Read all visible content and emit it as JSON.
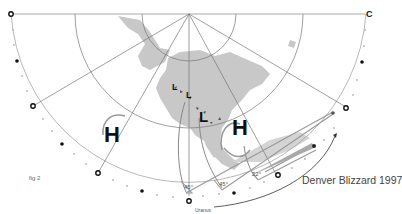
{
  "figure": {
    "title": "Denver Blizzard 1997",
    "figure_label": "fig 2",
    "planet_label": "Uranus",
    "corner_label": "C",
    "angles": [
      "45°",
      "45°",
      "22°"
    ],
    "pressure_systems": {
      "highs": [
        "H",
        "H"
      ],
      "lows": [
        "L",
        "L",
        "L"
      ]
    }
  },
  "colors": {
    "land": "#c8c8c8",
    "grid_line": "#777777",
    "arrow_line": "#888888",
    "text": "#333333"
  }
}
